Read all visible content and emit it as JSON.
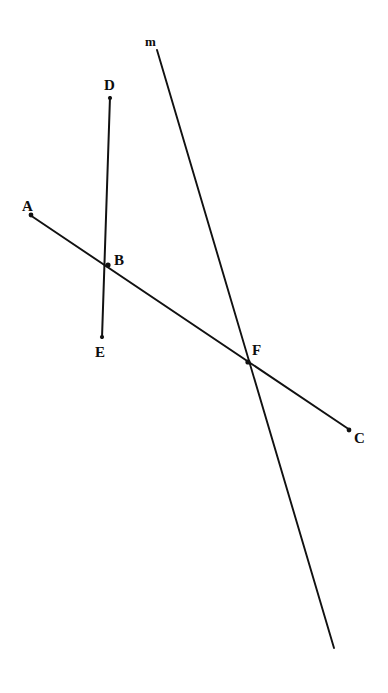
{
  "figure": {
    "canvas": {
      "width": 388,
      "height": 693,
      "background": "#ffffff"
    },
    "stroke_color": "#111111",
    "label_color": "#0d0d0d",
    "labels": [
      {
        "id": "label-m",
        "text": "m",
        "x": 145,
        "y": 35,
        "size": "line",
        "describes": "line-m"
      },
      {
        "id": "label-D",
        "text": "D",
        "x": 104,
        "y": 78,
        "size": "point",
        "describes": "point-D"
      },
      {
        "id": "label-A",
        "text": "A",
        "x": 22,
        "y": 199,
        "size": "point",
        "describes": "point-A"
      },
      {
        "id": "label-B",
        "text": "B",
        "x": 114,
        "y": 253,
        "size": "point",
        "describes": "point-B"
      },
      {
        "id": "label-E",
        "text": "E",
        "x": 95,
        "y": 345,
        "size": "point",
        "describes": "point-E"
      },
      {
        "id": "label-F",
        "text": "F",
        "x": 252,
        "y": 343,
        "size": "point",
        "describes": "point-F"
      },
      {
        "id": "label-C",
        "text": "C",
        "x": 354,
        "y": 431,
        "size": "point",
        "describes": "point-C"
      }
    ],
    "segments": [
      {
        "id": "segment-DE",
        "name": "segment-de",
        "x1": 110,
        "y1": 97,
        "x2": 102,
        "y2": 338,
        "width": 2.0
      },
      {
        "id": "segment-AC",
        "name": "segment-ac",
        "x1": 30,
        "y1": 215,
        "x2": 350,
        "y2": 430,
        "width": 1.9
      },
      {
        "id": "line-m",
        "name": "line-m",
        "x1": 157,
        "y1": 50,
        "x2": 334,
        "y2": 648,
        "width": 1.9
      }
    ],
    "dots": [
      {
        "id": "dot-D",
        "name": "endpoint-dot-d",
        "x": 110,
        "y": 98,
        "r": 2.1
      },
      {
        "id": "dot-E",
        "name": "endpoint-dot-e",
        "x": 102,
        "y": 337,
        "r": 2.1
      },
      {
        "id": "dot-A",
        "name": "endpoint-dot-a",
        "x": 31,
        "y": 215,
        "r": 2.4
      },
      {
        "id": "dot-C",
        "name": "endpoint-dot-c",
        "x": 349,
        "y": 430,
        "r": 2.4
      },
      {
        "id": "dot-B",
        "name": "intersection-dot-b",
        "x": 108,
        "y": 265,
        "r": 2.6
      },
      {
        "id": "dot-F",
        "name": "intersection-dot-f",
        "x": 248,
        "y": 362,
        "r": 2.6
      }
    ]
  },
  "chart_data": {
    "type": "diagram",
    "points": [
      {
        "name": "A",
        "x": 30,
        "y": 215,
        "role": "endpoint of segment AC"
      },
      {
        "name": "B",
        "x": 108,
        "y": 265,
        "role": "intersection of segment AC and segment DE"
      },
      {
        "name": "C",
        "x": 350,
        "y": 430,
        "role": "endpoint of segment AC"
      },
      {
        "name": "D",
        "x": 110,
        "y": 97,
        "role": "endpoint of segment DE"
      },
      {
        "name": "E",
        "x": 102,
        "y": 338,
        "role": "endpoint of segment DE"
      },
      {
        "name": "F",
        "x": 248,
        "y": 362,
        "role": "intersection of segment AC and line m"
      }
    ],
    "lines": [
      {
        "name": "DE",
        "from": "D",
        "to": "E",
        "label": ""
      },
      {
        "name": "AC",
        "from": "A",
        "to": "C",
        "label": ""
      },
      {
        "name": "m",
        "from": [
          157,
          50
        ],
        "to": [
          334,
          648
        ],
        "label": "m"
      }
    ],
    "intersections": [
      {
        "point": "B",
        "of": [
          "DE",
          "AC"
        ]
      },
      {
        "point": "F",
        "of": [
          "m",
          "AC"
        ]
      }
    ]
  }
}
